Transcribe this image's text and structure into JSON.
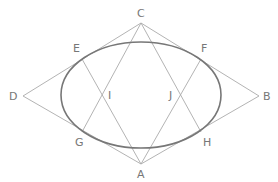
{
  "diagram": {
    "type": "geometry",
    "colors": {
      "lines": "#aaaaaa",
      "ellipse": "#777777",
      "labels": "#777777",
      "background": "#ffffff"
    },
    "ellipse": {
      "cx": 141,
      "cy": 95,
      "rx": 80,
      "ry": 53
    },
    "points": {
      "A": {
        "label": "A",
        "x": 141,
        "y": 164
      },
      "B": {
        "label": "B",
        "x": 259,
        "y": 96
      },
      "C": {
        "label": "C",
        "x": 141,
        "y": 23
      },
      "D": {
        "label": "D",
        "x": 23,
        "y": 96
      },
      "E": {
        "label": "E",
        "x": 82,
        "y": 59
      },
      "F": {
        "label": "F",
        "x": 201,
        "y": 59
      },
      "G": {
        "label": "G",
        "x": 82,
        "y": 132
      },
      "H": {
        "label": "H",
        "x": 201,
        "y": 132
      },
      "I": {
        "label": "I",
        "x": 103,
        "y": 95
      },
      "J": {
        "label": "J",
        "x": 179,
        "y": 95
      }
    },
    "segments": [
      [
        "C",
        "D"
      ],
      [
        "C",
        "B"
      ],
      [
        "A",
        "D"
      ],
      [
        "A",
        "B"
      ],
      [
        "C",
        "G"
      ],
      [
        "C",
        "H"
      ],
      [
        "A",
        "E"
      ],
      [
        "A",
        "F"
      ],
      [
        "E",
        "I"
      ],
      [
        "F",
        "J"
      ],
      [
        "G",
        "I"
      ],
      [
        "H",
        "J"
      ]
    ]
  }
}
